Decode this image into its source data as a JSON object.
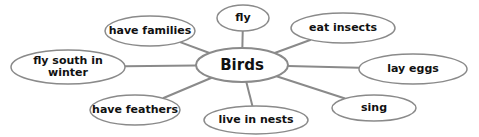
{
  "diagram": {
    "type": "concept-web",
    "center": {
      "label": "Birds",
      "cx": 242,
      "cy": 65,
      "rx": 46,
      "ry": 17
    },
    "line_color": "#8a8a8a",
    "ellipse_stroke": "#8a8a8a",
    "nodes": [
      {
        "id": "fly",
        "label": "fly",
        "cx": 243,
        "cy": 18,
        "rx": 26,
        "ry": 13
      },
      {
        "id": "eat-insects",
        "label": "eat insects",
        "cx": 343,
        "cy": 28,
        "rx": 52,
        "ry": 15
      },
      {
        "id": "lay-eggs",
        "label": "lay eggs",
        "cx": 413,
        "cy": 69,
        "rx": 54,
        "ry": 15
      },
      {
        "id": "sing",
        "label": "sing",
        "cx": 374,
        "cy": 108,
        "rx": 42,
        "ry": 13
      },
      {
        "id": "live-in-nests",
        "label": "live in nests",
        "cx": 256,
        "cy": 120,
        "rx": 52,
        "ry": 14
      },
      {
        "id": "have-feathers",
        "label": "have feathers",
        "cx": 135,
        "cy": 110,
        "rx": 45,
        "ry": 15
      },
      {
        "id": "fly-south-in-winter",
        "label": "fly south in\nwinter",
        "cx": 68,
        "cy": 67,
        "rx": 57,
        "ry": 17
      },
      {
        "id": "have-families",
        "label": "have families",
        "cx": 150,
        "cy": 31,
        "rx": 45,
        "ry": 15
      }
    ]
  }
}
